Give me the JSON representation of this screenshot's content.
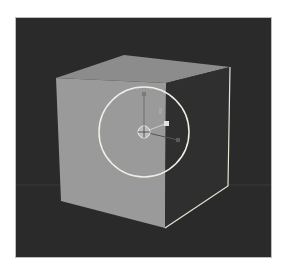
{
  "viewport": {
    "background": "#2a2a2a",
    "grid_line_color": "#3a3a3a"
  },
  "cube": {
    "top_face_color": "#8c8c8c",
    "left_face_color": "#9a9a9a",
    "right_face_color": "#2e2e2e",
    "selected_edge_color": "#e6e6d6"
  },
  "gizmo": {
    "rotate_circle_color": "#f0f0e6",
    "center": [
      144,
      132
    ],
    "radius": 45
  }
}
